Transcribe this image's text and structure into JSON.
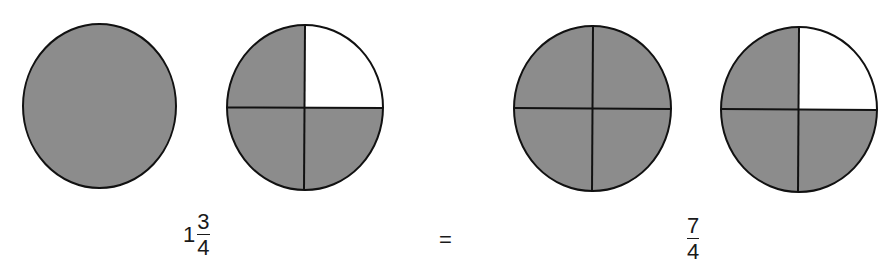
{
  "colors": {
    "shaded": "#8c8c8c",
    "unshaded": "#ffffff",
    "stroke": "#111111",
    "background": "#ffffff"
  },
  "circles": [
    {
      "id": "whole-1",
      "divided": false,
      "shaded_quarters": 4,
      "unshaded_quarter": null
    },
    {
      "id": "part-3-of-4",
      "divided": true,
      "shaded_quarters": 3,
      "unshaded_quarter": "top-right"
    },
    {
      "id": "whole-4-of-4",
      "divided": true,
      "shaded_quarters": 4,
      "unshaded_quarter": null
    },
    {
      "id": "part-3-of-4-b",
      "divided": true,
      "shaded_quarters": 3,
      "unshaded_quarter": "top-right"
    }
  ],
  "equation": {
    "left": {
      "whole": "1",
      "numerator": "3",
      "denominator": "4"
    },
    "operator": "=",
    "right": {
      "numerator": "7",
      "denominator": "4"
    }
  }
}
